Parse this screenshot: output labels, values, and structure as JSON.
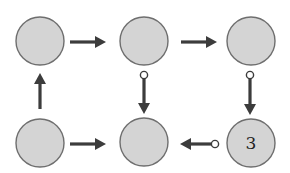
{
  "diagram": {
    "type": "state-graph",
    "colors": {
      "node_fill": "#d4d4d4",
      "node_stroke": "#6e6e6e",
      "edge": "#3c3c3c",
      "background": "#ffffff"
    },
    "nodes": [
      {
        "id": "n00",
        "row": 0,
        "col": 0,
        "label": ""
      },
      {
        "id": "n01",
        "row": 0,
        "col": 1,
        "label": ""
      },
      {
        "id": "n02",
        "row": 0,
        "col": 2,
        "label": ""
      },
      {
        "id": "n10",
        "row": 1,
        "col": 0,
        "label": ""
      },
      {
        "id": "n11",
        "row": 1,
        "col": 1,
        "label": ""
      },
      {
        "id": "n12",
        "row": 1,
        "col": 2,
        "label": "3"
      }
    ],
    "edges": [
      {
        "from": "n00",
        "to": "n01",
        "direction": "right",
        "tail": "plain"
      },
      {
        "from": "n01",
        "to": "n02",
        "direction": "right",
        "tail": "plain"
      },
      {
        "from": "n10",
        "to": "n00",
        "direction": "up",
        "tail": "plain"
      },
      {
        "from": "n01",
        "to": "n11",
        "direction": "down",
        "tail": "open-circle"
      },
      {
        "from": "n02",
        "to": "n12",
        "direction": "down",
        "tail": "open-circle"
      },
      {
        "from": "n10",
        "to": "n11",
        "direction": "right",
        "tail": "plain"
      },
      {
        "from": "n12",
        "to": "n11",
        "direction": "left",
        "tail": "open-circle"
      }
    ]
  }
}
